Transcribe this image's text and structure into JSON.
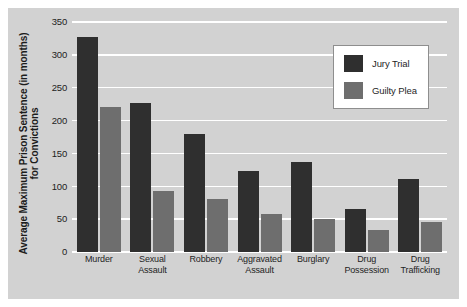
{
  "chart_data": {
    "type": "bar",
    "title": "",
    "xlabel": "",
    "ylabel": "Average Maximum Prison Sentence (in months) for Convictions",
    "ylabel_lines": [
      "Average Maximum Prison Sentence (in months)",
      "for Convictions"
    ],
    "categories": [
      "Murder",
      "Sexual Assault",
      "Robbery",
      "Aggravated Assault",
      "Burglary",
      "Drug Possession",
      "Drug Trafficking"
    ],
    "category_lines": [
      [
        "Murder"
      ],
      [
        "Sexual",
        "Assault"
      ],
      [
        "Robbery"
      ],
      [
        "Aggravated",
        "Assault"
      ],
      [
        "Burglary"
      ],
      [
        "Drug",
        "Possession"
      ],
      [
        "Drug",
        "Trafficking"
      ]
    ],
    "series": [
      {
        "name": "Jury Trial",
        "color": "#2f2f2f",
        "values": [
          327,
          227,
          180,
          123,
          137,
          65,
          111
        ]
      },
      {
        "name": "Guilty Plea",
        "color": "#6e6e6e",
        "values": [
          220,
          93,
          80,
          58,
          50,
          33,
          45
        ]
      }
    ],
    "ylim": [
      0,
      350
    ],
    "yticks": [
      0,
      50,
      100,
      150,
      200,
      250,
      300,
      350
    ],
    "ytick_labels": [
      "0",
      "50",
      "100",
      "150",
      "200",
      "250",
      "300",
      "350"
    ],
    "grid": true,
    "grid_color": "#ffffff",
    "legend_position": "upper right",
    "plot_background": "#d2d2d2",
    "figure_background": "#ffffff"
  }
}
